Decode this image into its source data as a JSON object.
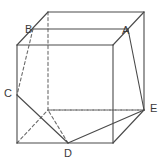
{
  "figure": {
    "type": "geometry-diagram",
    "width": 162,
    "height": 163,
    "background_color": "#ffffff",
    "line_color": "#4a4a4a",
    "hidden_line_color": "#6b6b6b",
    "label_color": "#3a3a3a",
    "solid_stroke_width": 1.1,
    "hidden_stroke_width": 1.1,
    "hidden_dash_pattern": "3,2.6"
  },
  "labels": [
    {
      "id": "B",
      "text": "B",
      "x": 25,
      "y": 24
    },
    {
      "id": "A",
      "text": "A",
      "x": 122,
      "y": 25
    },
    {
      "id": "C",
      "text": "C",
      "x": 4,
      "y": 88
    },
    {
      "id": "E",
      "text": "E",
      "x": 150,
      "y": 103
    },
    {
      "id": "D",
      "text": "D",
      "x": 64,
      "y": 148
    }
  ],
  "points": {
    "front_top_left": {
      "x": 17,
      "y": 45
    },
    "front_top_right": {
      "x": 113,
      "y": 45
    },
    "front_bottom_right": {
      "x": 113,
      "y": 143
    },
    "front_bottom_left": {
      "x": 17,
      "y": 143
    },
    "back_top_left": {
      "x": 48,
      "y": 12
    },
    "back_top_right": {
      "x": 144,
      "y": 12
    },
    "back_bottom_right": {
      "x": 144,
      "y": 110
    },
    "back_bottom_left": {
      "x": 48,
      "y": 110
    },
    "B": {
      "x": 33,
      "y": 29
    },
    "A": {
      "x": 128,
      "y": 29
    },
    "C": {
      "x": 17,
      "y": 95
    },
    "D": {
      "x": 68,
      "y": 143
    },
    "E": {
      "x": 144,
      "y": 110
    }
  },
  "solid_edges": [
    {
      "name": "front-top-edge",
      "from": "front_top_left",
      "to": "front_top_right"
    },
    {
      "name": "front-left-edge",
      "from": "front_top_left",
      "to": "front_bottom_left"
    },
    {
      "name": "front-right-edge",
      "from": "front_top_right",
      "to": "front_bottom_right"
    },
    {
      "name": "front-bottom-edge",
      "from": "front_bottom_left",
      "to": "front_bottom_right"
    },
    {
      "name": "top-back-edge",
      "from": "back_top_left",
      "to": "back_top_right"
    },
    {
      "name": "top-left-diagonal-edge",
      "from": "front_top_left",
      "to": "back_top_left"
    },
    {
      "name": "top-right-diagonal-edge",
      "from": "front_top_right",
      "to": "back_top_right"
    },
    {
      "name": "back-right-edge",
      "from": "back_top_right",
      "to": "back_bottom_right"
    },
    {
      "name": "right-diagonal-edge",
      "from": "front_bottom_right",
      "to": "back_bottom_right"
    },
    {
      "name": "cut-B-to-A",
      "from": "B",
      "to": "A"
    },
    {
      "name": "cut-A-to-E",
      "from": "A",
      "to": "E"
    },
    {
      "name": "cut-C-to-D",
      "from": "C",
      "to": "D"
    },
    {
      "name": "cut-D-to-E",
      "from": "D",
      "to": "E"
    }
  ],
  "hidden_edges": [
    {
      "name": "back-left-vertical-edge",
      "from": "back_top_left",
      "to": "back_bottom_left"
    },
    {
      "name": "back-bottom-edge",
      "from": "back_bottom_left",
      "to": "back_bottom_right"
    },
    {
      "name": "left-bottom-diagonal-edge",
      "from": "front_bottom_left",
      "to": "back_bottom_left"
    },
    {
      "name": "cut-B-to-C-hidden",
      "from": "B",
      "to": "C"
    },
    {
      "name": "cut-D-to-backleft-hidden",
      "from": "D",
      "to": "back_bottom_left"
    },
    {
      "name": "cut-E-to-backleft-hidden",
      "from": "E",
      "to": "back_bottom_left"
    }
  ]
}
